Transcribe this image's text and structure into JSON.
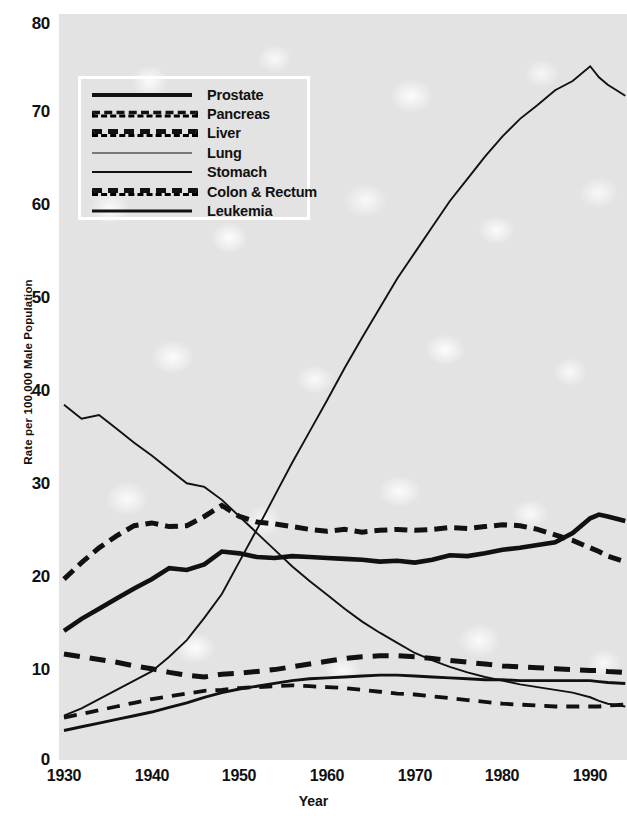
{
  "chart_data": {
    "type": "line",
    "title": "",
    "xlabel": "Year",
    "ylabel": "Rate per 100,000 Male Population",
    "xlim": [
      1930,
      1994
    ],
    "ylim": [
      0,
      80
    ],
    "xticks": [
      "1930",
      "1940",
      "1950",
      "1960",
      "1970",
      "1980",
      "1990"
    ],
    "xtick_values": [
      1930,
      1940,
      1950,
      1960,
      1970,
      1980,
      1990
    ],
    "yticks": [
      "0",
      "10",
      "20",
      "30",
      "40",
      "50",
      "60",
      "70",
      "80"
    ],
    "ytick_values": [
      0,
      10,
      20,
      30,
      40,
      50,
      60,
      70,
      80
    ],
    "grid": false,
    "legend_position": "upper-left-inside",
    "x": [
      1930,
      1932,
      1934,
      1936,
      1938,
      1940,
      1942,
      1944,
      1946,
      1948,
      1950,
      1952,
      1954,
      1956,
      1958,
      1960,
      1962,
      1964,
      1966,
      1968,
      1970,
      1972,
      1974,
      1976,
      1978,
      1980,
      1982,
      1984,
      1986,
      1988,
      1990,
      1991,
      1992,
      1994
    ],
    "series": [
      {
        "name": "Prostate",
        "style": "thick-solid",
        "values": [
          14.0,
          15.3,
          16.4,
          17.5,
          18.6,
          19.6,
          20.8,
          20.6,
          21.2,
          22.6,
          22.4,
          22.0,
          21.9,
          22.1,
          22.0,
          21.9,
          21.8,
          21.7,
          21.5,
          21.6,
          21.4,
          21.7,
          22.2,
          22.1,
          22.4,
          22.8,
          23.0,
          23.3,
          23.6,
          24.6,
          26.2,
          26.6,
          26.4,
          25.9
        ]
      },
      {
        "name": "Pancreas",
        "style": "medium-dash",
        "values": [
          4.6,
          5.0,
          5.4,
          5.8,
          6.2,
          6.6,
          6.9,
          7.2,
          7.5,
          7.6,
          7.8,
          7.9,
          8.0,
          8.1,
          8.0,
          7.9,
          7.8,
          7.6,
          7.4,
          7.2,
          7.1,
          6.9,
          6.7,
          6.5,
          6.3,
          6.1,
          6.0,
          5.9,
          5.8,
          5.8,
          5.8,
          5.8,
          5.9,
          6.0
        ]
      },
      {
        "name": "Liver",
        "style": "thick-dash",
        "values": [
          11.5,
          11.2,
          10.9,
          10.6,
          10.2,
          9.9,
          9.5,
          9.2,
          9.0,
          9.3,
          9.4,
          9.6,
          9.8,
          10.1,
          10.4,
          10.7,
          11.0,
          11.2,
          11.3,
          11.3,
          11.2,
          11.0,
          10.8,
          10.6,
          10.4,
          10.2,
          10.1,
          10.0,
          9.9,
          9.8,
          9.7,
          9.7,
          9.6,
          9.5
        ]
      },
      {
        "name": "Lung",
        "style": "thin-solid",
        "values": [
          4.8,
          5.6,
          6.6,
          7.6,
          8.6,
          9.6,
          11.2,
          13.0,
          15.4,
          18.0,
          21.5,
          25.0,
          28.6,
          32.2,
          35.6,
          39.0,
          42.5,
          45.8,
          49.0,
          52.2,
          55.0,
          57.8,
          60.6,
          63.0,
          65.4,
          67.6,
          69.5,
          71.0,
          72.6,
          73.6,
          75.2,
          74.0,
          73.2,
          72.0
        ]
      },
      {
        "name": "Stomach",
        "style": "thin-solid",
        "values": [
          38.5,
          37.0,
          37.4,
          35.9,
          34.4,
          33.0,
          31.5,
          30.0,
          29.6,
          28.2,
          26.4,
          24.6,
          22.8,
          21.0,
          19.4,
          17.9,
          16.4,
          15.0,
          13.8,
          12.7,
          11.6,
          10.8,
          10.1,
          9.5,
          9.0,
          8.6,
          8.2,
          7.9,
          7.6,
          7.3,
          6.8,
          6.4,
          6.1,
          5.8
        ]
      },
      {
        "name": "Colon & Rectum",
        "style": "thick-short-dash",
        "values": [
          19.6,
          21.4,
          23.0,
          24.3,
          25.4,
          25.7,
          25.3,
          25.4,
          26.4,
          27.6,
          26.4,
          25.8,
          25.6,
          25.3,
          25.0,
          24.8,
          25.0,
          24.7,
          24.9,
          25.0,
          24.9,
          25.0,
          25.2,
          25.1,
          25.3,
          25.5,
          25.4,
          25.0,
          24.4,
          23.8,
          23.0,
          22.6,
          22.1,
          21.5
        ]
      },
      {
        "name": "Leukemia",
        "style": "medium-solid",
        "values": [
          3.2,
          3.6,
          4.0,
          4.4,
          4.8,
          5.2,
          5.7,
          6.2,
          6.8,
          7.3,
          7.7,
          8.0,
          8.3,
          8.6,
          8.8,
          8.9,
          9.0,
          9.1,
          9.2,
          9.2,
          9.1,
          9.0,
          8.9,
          8.8,
          8.7,
          8.7,
          8.6,
          8.6,
          8.6,
          8.6,
          8.6,
          8.5,
          8.4,
          8.3
        ]
      }
    ]
  },
  "axes": {
    "y_label": "Rate per 100,000 Male Population",
    "x_label": "Year",
    "y_ticks": [
      "80",
      "70",
      "60",
      "50",
      "40",
      "30",
      "20",
      "10",
      "0"
    ],
    "x_ticks": [
      "1930",
      "1940",
      "1950",
      "1960",
      "1970",
      "1980",
      "1990"
    ]
  },
  "legend": {
    "items": [
      {
        "label": "Prostate",
        "style_class": "ln-prostate"
      },
      {
        "label": "Pancreas",
        "style_class": "ln-pancreas"
      },
      {
        "label": "Liver",
        "style_class": "ln-liver"
      },
      {
        "label": "Lung",
        "style_class": "ln-lung"
      },
      {
        "label": "Stomach",
        "style_class": "ln-stomach"
      },
      {
        "label": "Colon & Rectum",
        "style_class": "ln-colon"
      },
      {
        "label": "Leukemia",
        "style_class": "ln-leukemia"
      }
    ]
  },
  "colors": {
    "line": "#111111",
    "plot_background": "#e3e3e3",
    "page_background": "#ffffff",
    "legend_border": "#ffffff"
  }
}
